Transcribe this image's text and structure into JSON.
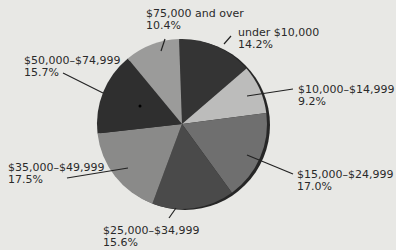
{
  "chart_data": {
    "type": "pie",
    "title": "",
    "center": [
      182,
      124
    ],
    "radius": 85,
    "start_angle_deg": -2,
    "slices": [
      {
        "label": "under $10,000",
        "value": 14.2,
        "pct_text": "14.2%",
        "color": "#343434"
      },
      {
        "label": "$10,000–$14,999",
        "value": 9.2,
        "pct_text": "9.2%",
        "color": "#bcbcbb"
      },
      {
        "label": "$15,000–$24,999",
        "value": 17.0,
        "pct_text": "17.0%",
        "color": "#6f6f6f"
      },
      {
        "label": "$25,000–$34,999",
        "value": 15.6,
        "pct_text": "15.6%",
        "color": "#4a4a4a"
      },
      {
        "label": "$35,000–$49,999",
        "value": 17.5,
        "pct_text": "17.5%",
        "color": "#8a8a89"
      },
      {
        "label": "$50,000–$74,999",
        "value": 15.7,
        "pct_text": "15.7%",
        "color": "#2f2f2f"
      },
      {
        "label": "$75,000 and over",
        "value": 10.4,
        "pct_text": "10.4%",
        "color": "#9b9b9a"
      }
    ],
    "legend": "none (callout labels)"
  },
  "labels": [
    {
      "name": "under $10,000",
      "pct": "14.2%",
      "x": 238,
      "y": 27,
      "line": [
        [
          224,
          44
        ],
        [
          231,
          36
        ]
      ]
    },
    {
      "name": "$10,000–$14,999",
      "pct": "9.2%",
      "x": 298,
      "y": 84,
      "line": [
        [
          247,
          96
        ],
        [
          293,
          89
        ]
      ]
    },
    {
      "name": "$15,000–$24,999",
      "pct": "17.0%",
      "x": 297,
      "y": 169,
      "line": [
        [
          247,
          155
        ],
        [
          293,
          174
        ]
      ]
    },
    {
      "name": "$25,000–$34,999",
      "pct": "15.6%",
      "x": 103,
      "y": 225,
      "line": [
        [
          176,
          208
        ],
        [
          169,
          218
        ]
      ]
    },
    {
      "name": "$35,000–$49,999",
      "pct": "17.5%",
      "x": 8,
      "y": 162,
      "line": [
        [
          128,
          168
        ],
        [
          67,
          178
        ]
      ]
    },
    {
      "name": "$50,000–$74,999",
      "pct": "15.7%",
      "x": 24,
      "y": 55,
      "line": [
        [
          63,
          73
        ],
        [
          103,
          93
        ]
      ]
    },
    {
      "name": "$75,000 and over",
      "pct": "10.4%",
      "x": 146,
      "y": 8,
      "line": [
        [
          165,
          39
        ],
        [
          161,
          51
        ]
      ]
    }
  ]
}
